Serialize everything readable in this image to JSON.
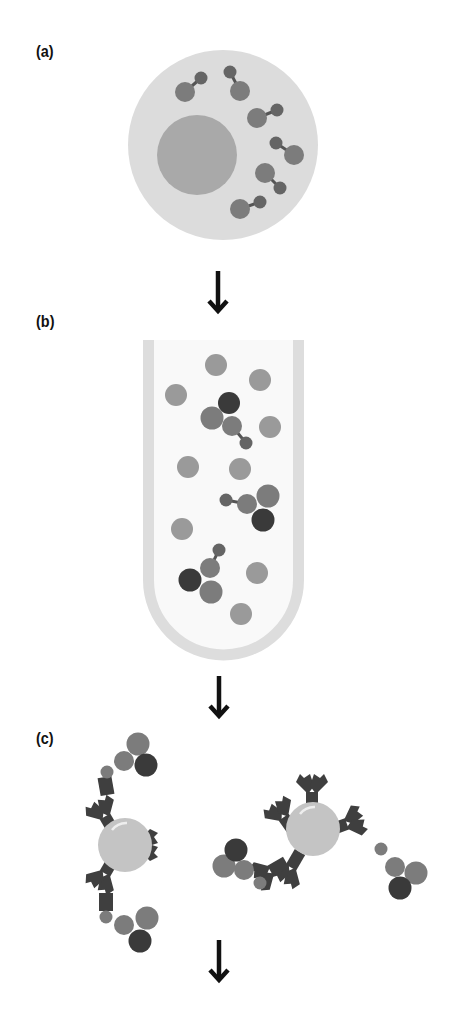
{
  "panels": [
    {
      "id": "a",
      "label": "(a)",
      "description": "Cell with nucleus and attached molecules"
    },
    {
      "id": "b",
      "label": "(b)",
      "description": "Test tube containing free and bound molecules"
    },
    {
      "id": "c",
      "label": "(c)",
      "description": "Antibody-coated beads capturing molecule complexes"
    }
  ],
  "arrows": [
    "arrow-down",
    "arrow-down",
    "arrow-down"
  ],
  "colors": {
    "cell": "#dcdcdc",
    "nucleus": "#a9a9a9",
    "molecule_mid": "#7c7c7c",
    "molecule_small": "#656565",
    "molecule_light": "#9a9a9a",
    "molecule_dark": "#3a3a3a",
    "tube": "#dddddd",
    "bead": "#c4c4c4",
    "antibody": "#3f3f3f",
    "arrow": "#111111"
  }
}
